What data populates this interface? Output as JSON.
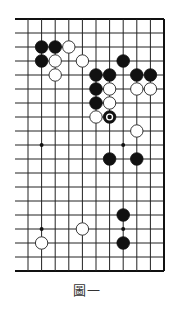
{
  "diagram": {
    "caption": "圖一",
    "board": {
      "columns": 11,
      "rows": 19,
      "origin_x": 28,
      "origin_y": 19,
      "spacing_x": 13.6,
      "spacing_y": 14.0,
      "left_extension_x": 15,
      "edges": [
        "top",
        "right",
        "bottom"
      ],
      "line_color": "#222222",
      "edge_color": "#111111"
    },
    "star_points": [
      {
        "col": 1,
        "row": 9
      },
      {
        "col": 7,
        "row": 9
      },
      {
        "col": 1,
        "row": 15
      },
      {
        "col": 7,
        "row": 15
      }
    ],
    "stones": [
      {
        "color": "black",
        "col": 1,
        "row": 2
      },
      {
        "color": "black",
        "col": 2,
        "row": 2
      },
      {
        "color": "white",
        "col": 3,
        "row": 2
      },
      {
        "color": "black",
        "col": 1,
        "row": 3
      },
      {
        "color": "white",
        "col": 2,
        "row": 3
      },
      {
        "color": "white",
        "col": 4,
        "row": 3
      },
      {
        "color": "black",
        "col": 7,
        "row": 3
      },
      {
        "color": "white",
        "col": 2,
        "row": 4
      },
      {
        "color": "black",
        "col": 5,
        "row": 4
      },
      {
        "color": "black",
        "col": 6,
        "row": 4
      },
      {
        "color": "black",
        "col": 8,
        "row": 4
      },
      {
        "color": "black",
        "col": 9,
        "row": 4
      },
      {
        "color": "black",
        "col": 5,
        "row": 5
      },
      {
        "color": "white",
        "col": 6,
        "row": 5
      },
      {
        "color": "white",
        "col": 8,
        "row": 5
      },
      {
        "color": "white",
        "col": 9,
        "row": 5
      },
      {
        "color": "black",
        "col": 5,
        "row": 6
      },
      {
        "color": "white",
        "col": 6,
        "row": 6
      },
      {
        "color": "white",
        "col": 5,
        "row": 7
      },
      {
        "color": "black",
        "col": 6,
        "row": 7,
        "marked": true
      },
      {
        "color": "white",
        "col": 8,
        "row": 8
      },
      {
        "color": "black",
        "col": 6,
        "row": 10
      },
      {
        "color": "black",
        "col": 8,
        "row": 10
      },
      {
        "color": "black",
        "col": 7,
        "row": 14
      },
      {
        "color": "white",
        "col": 4,
        "row": 15
      },
      {
        "color": "white",
        "col": 1,
        "row": 16
      },
      {
        "color": "black",
        "col": 7,
        "row": 16
      }
    ]
  }
}
